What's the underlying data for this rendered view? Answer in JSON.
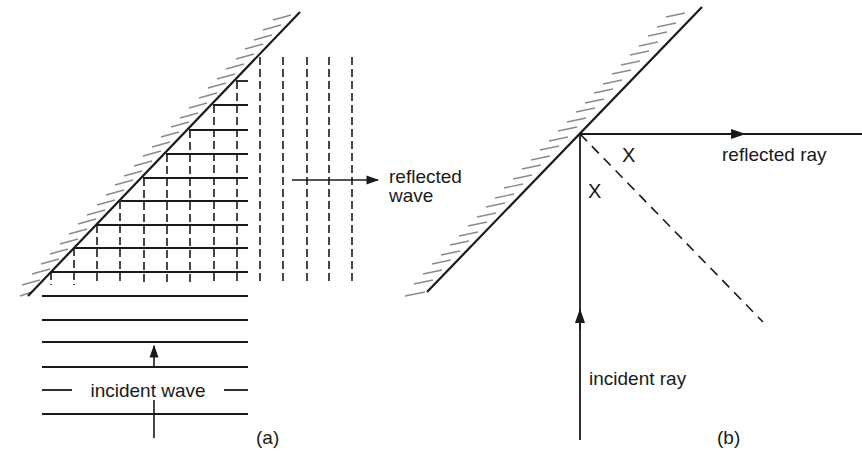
{
  "figure": {
    "panel_a": {
      "label": "(a)",
      "incident_label": "incident wave",
      "reflected_label_line1": "reflected",
      "reflected_label_line2": "wave"
    },
    "panel_b": {
      "label": "(b)",
      "incident_label": "incident ray",
      "reflected_label": "reflected ray",
      "angle_label_1": "X",
      "angle_label_2": "X"
    },
    "colors": {
      "ink": "#1a1a1a",
      "hatch": "#888888",
      "background": "#ffffff"
    }
  }
}
